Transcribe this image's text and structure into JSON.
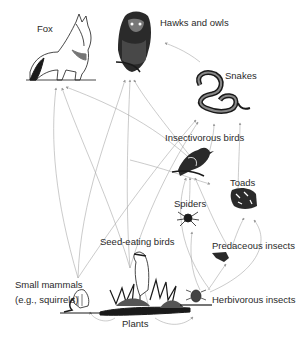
{
  "nodes": [
    {
      "id": "fox",
      "label": "Fox"
    },
    {
      "id": "hawks_owls",
      "label": "Hawks and owls"
    },
    {
      "id": "snakes",
      "label": "Snakes"
    },
    {
      "id": "insectivorous_birds",
      "label": "Insectivorous birds"
    },
    {
      "id": "toads",
      "label": "Toads"
    },
    {
      "id": "spiders",
      "label": "Spiders"
    },
    {
      "id": "seed_eating_birds",
      "label": "Seed-eating birds"
    },
    {
      "id": "predaceous_insects",
      "label": "Predaceous insects"
    },
    {
      "id": "small_mammals",
      "label": "Small mammals",
      "sublabel": "(e.g., squirrels)"
    },
    {
      "id": "plants",
      "label": "Plants"
    },
    {
      "id": "herbivorous_insects",
      "label": "Herbivorous insects"
    }
  ],
  "edges": [
    {
      "from": "small_mammals",
      "to": "fox"
    },
    {
      "from": "seed_eating_birds",
      "to": "fox"
    },
    {
      "from": "insectivorous_birds",
      "to": "fox"
    },
    {
      "from": "small_mammals",
      "to": "hawks_owls"
    },
    {
      "from": "seed_eating_birds",
      "to": "hawks_owls"
    },
    {
      "from": "snakes",
      "to": "hawks_owls"
    },
    {
      "from": "insectivorous_birds",
      "to": "hawks_owls"
    },
    {
      "from": "small_mammals",
      "to": "snakes"
    },
    {
      "from": "seed_eating_birds",
      "to": "snakes"
    },
    {
      "from": "toads",
      "to": "snakes"
    },
    {
      "from": "insectivorous_birds",
      "to": "snakes"
    },
    {
      "from": "spiders",
      "to": "insectivorous_birds"
    },
    {
      "from": "predaceous_insects",
      "to": "insectivorous_birds"
    },
    {
      "from": "herbivorous_insects",
      "to": "insectivorous_birds"
    },
    {
      "from": "predaceous_insects",
      "to": "toads"
    },
    {
      "from": "herbivorous_insects",
      "to": "toads"
    },
    {
      "from": "herbivorous_insects",
      "to": "spiders"
    },
    {
      "from": "herbivorous_insects",
      "to": "predaceous_insects"
    },
    {
      "from": "plants",
      "to": "small_mammals"
    },
    {
      "from": "plants",
      "to": "seed_eating_birds"
    },
    {
      "from": "plants",
      "to": "herbivorous_insects"
    }
  ],
  "colors": {
    "line": "#9a9a9a",
    "ink": "#1a1a1a",
    "background": "#ffffff"
  }
}
